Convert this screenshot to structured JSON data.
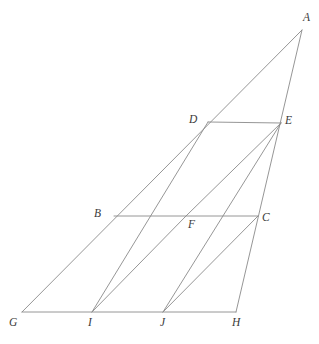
{
  "figure": {
    "background_color": "#ffffff",
    "stroke_color": "#8a8a8a",
    "label_color": "#3a3a3a",
    "label_style": "italic-serif",
    "width": 319,
    "height": 344,
    "points": [
      {
        "id": "A",
        "label": "A",
        "x": 302,
        "y": 30,
        "label_x": 303,
        "label_y": 12
      },
      {
        "id": "B",
        "label": "B",
        "x": 114,
        "y": 216,
        "label_x": 94,
        "label_y": 208
      },
      {
        "id": "C",
        "label": "C",
        "x": 258,
        "y": 216,
        "label_x": 262,
        "label_y": 212
      },
      {
        "id": "D",
        "label": "D",
        "x": 208,
        "y": 122,
        "label_x": 189,
        "label_y": 114
      },
      {
        "id": "E",
        "label": "E",
        "x": 281,
        "y": 123,
        "label_x": 285,
        "label_y": 115
      },
      {
        "id": "F",
        "label": "F",
        "x": 186,
        "y": 216,
        "label_x": 188,
        "label_y": 219
      },
      {
        "id": "G",
        "label": "G",
        "x": 22,
        "y": 312,
        "label_x": 9,
        "label_y": 317
      },
      {
        "id": "H",
        "label": "H",
        "x": 236,
        "y": 312,
        "label_x": 232,
        "label_y": 317
      },
      {
        "id": "I",
        "label": "I",
        "x": 92,
        "y": 312,
        "label_x": 88,
        "label_y": 317
      },
      {
        "id": "J",
        "label": "J",
        "x": 163,
        "y": 312,
        "label_x": 160,
        "label_y": 317
      }
    ],
    "segments": [
      {
        "name": "G-A-diagonal",
        "from": "G",
        "to": "A"
      },
      {
        "name": "H-A-edge",
        "from": "H",
        "to": "A"
      },
      {
        "name": "G-H-baseline",
        "from": "G",
        "to": "H"
      },
      {
        "name": "B-C-horizontal",
        "from": "B",
        "to": "C"
      },
      {
        "name": "D-E-horizontal",
        "from": "D",
        "to": "E"
      },
      {
        "name": "I-D-transversal",
        "from": "I",
        "to": "D"
      },
      {
        "name": "J-E-transversal",
        "from": "J",
        "to": "E"
      },
      {
        "name": "I-F-diagonal",
        "from": "I",
        "to": "F"
      },
      {
        "name": "J-C-diagonal",
        "from": "J",
        "to": "C"
      },
      {
        "name": "F-E-diagonal",
        "from": "F",
        "to": "E"
      }
    ]
  }
}
